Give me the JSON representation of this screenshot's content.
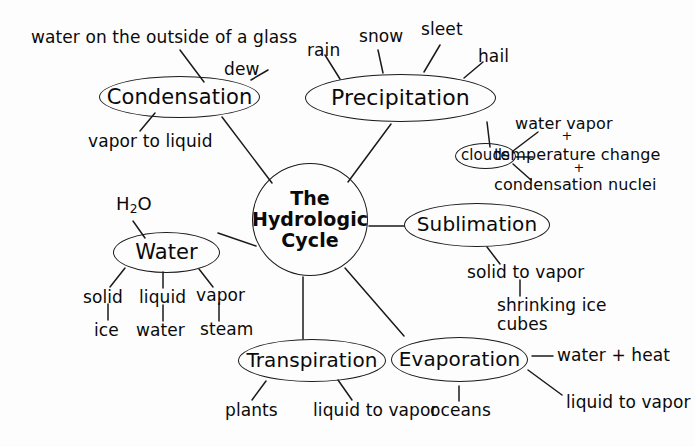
{
  "diagram": {
    "title": "The Hydrologic Cycle",
    "type": "concept-map",
    "background_color": "#fdfdfd",
    "ink_color": "#0a0a0a"
  },
  "center": {
    "line1": "The",
    "line2": "Hydrologic",
    "line3": "Cycle"
  },
  "nodes": {
    "condensation": "Condensation",
    "precipitation": "Precipitation",
    "clouds": "clouds",
    "sublimation": "Sublimation",
    "water": "Water",
    "transpiration": "Transpiration",
    "evaporation": "Evaporation"
  },
  "labels": {
    "water_on_glass": "water on the outside of a glass",
    "dew": "dew",
    "vapor_to_liquid": "vapor to liquid",
    "rain": "rain",
    "snow": "snow",
    "sleet": "sleet",
    "hail": "hail",
    "water_vapor": "water vapor",
    "plus_one": "+",
    "temperature_change": "temperature change",
    "plus_two": "+",
    "condensation_nuclei": "condensation nuclei",
    "solid_to_vapor": "solid to vapor",
    "shrinking_ice_cubes_line1": "shrinking ice",
    "shrinking_ice_cubes_line2": "cubes",
    "h2o_h": "H",
    "h2o_2": "2",
    "h2o_o": "O",
    "solid": "solid",
    "liquid": "liquid",
    "vapor": "vapor",
    "ice": "ice",
    "water_state": "water",
    "steam": "steam",
    "plants": "plants",
    "liquid_to_vapor_transpiration": "liquid to vapor",
    "oceans": "oceans",
    "water_plus_heat": "water + heat",
    "liquid_to_vapor_evaporation": "liquid to vapor"
  }
}
